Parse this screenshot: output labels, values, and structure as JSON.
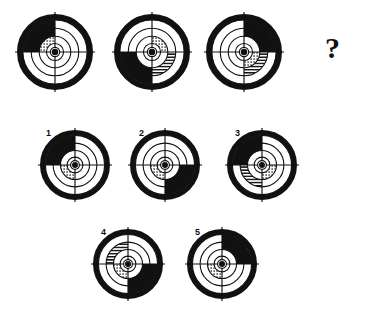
{
  "puzzle": {
    "title": "Concentric target sequence puzzle",
    "question_mark": "?",
    "style": {
      "ink": "#111111",
      "paper": "#ffffff",
      "fill_black": "#111111",
      "fill_hatch": "hatch",
      "fill_dots": "dots",
      "fill_white": "none"
    },
    "sequence": [
      {
        "id": "seq-1",
        "cx": 55,
        "cy": 52,
        "r": 38,
        "outer_black_quadrant": "upper-left",
        "middle_hatch_quadrant": "upper-left",
        "inner_dots_quadrant": "upper-left"
      },
      {
        "id": "seq-2",
        "cx": 152,
        "cy": 52,
        "r": 38,
        "outer_black_quadrant": "lower-left",
        "middle_hatch_quadrant": "lower-right",
        "inner_dots_quadrant": "upper-right"
      },
      {
        "id": "seq-3",
        "cx": 244,
        "cy": 52,
        "r": 38,
        "outer_black_quadrant": "upper-right",
        "middle_hatch_quadrant": "lower-right",
        "inner_dots_quadrant": "lower-right"
      }
    ],
    "answer_slot": {
      "cx": 333,
      "cy": 52,
      "label": "?"
    },
    "options": [
      {
        "number": "1",
        "cx": 75,
        "cy": 165,
        "r": 35,
        "num_x": 46,
        "num_y": 129,
        "outer_black_quadrant": "upper-left",
        "middle_hatch_quadrant": "upper-left",
        "inner_dots_quadrant": "lower-left"
      },
      {
        "number": "2",
        "cx": 165,
        "cy": 165,
        "r": 35,
        "num_x": 139,
        "num_y": 129,
        "outer_black_quadrant": "lower-right",
        "middle_hatch_quadrant": "lower-right",
        "inner_dots_quadrant": "lower-left"
      },
      {
        "number": "3",
        "cx": 262,
        "cy": 165,
        "r": 35,
        "num_x": 235,
        "num_y": 129,
        "outer_black_quadrant": "upper-left",
        "middle_hatch_quadrant": "lower-left",
        "inner_dots_quadrant": "lower-right"
      },
      {
        "number": "4",
        "cx": 128,
        "cy": 264,
        "r": 35,
        "num_x": 101,
        "num_y": 228,
        "outer_black_quadrant": "lower-right",
        "middle_hatch_quadrant": "upper-left",
        "inner_dots_quadrant": "lower-left"
      },
      {
        "number": "5",
        "cx": 222,
        "cy": 264,
        "r": 35,
        "num_x": 195,
        "num_y": 228,
        "outer_black_quadrant": "upper-right",
        "middle_hatch_quadrant": "upper-right",
        "inner_dots_quadrant": "lower-left"
      }
    ]
  }
}
